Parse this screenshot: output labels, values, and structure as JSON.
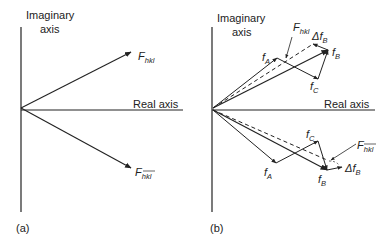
{
  "panels": [
    {
      "id": "a",
      "caption": "(a)",
      "axis_labels": {
        "imaginary_line1": "Imaginary",
        "imaginary_line2": "axis",
        "real": "Real axis"
      },
      "vectors": [
        {
          "name": "F_hkl",
          "symbol": "F",
          "subscript": "hkl",
          "overbar": false
        },
        {
          "name": "F_-h-k-l",
          "symbol": "F",
          "subscript": "hkl",
          "overbar": true
        }
      ]
    },
    {
      "id": "b",
      "caption": "(b)",
      "axis_labels": {
        "imaginary_line1": "Imaginary",
        "imaginary_line2": "axis",
        "real": "Real axis"
      },
      "upper_labels": {
        "fA": {
          "symbol": "f",
          "subscript": "A"
        },
        "fB": {
          "symbol": "f",
          "subscript": "B"
        },
        "fC": {
          "symbol": "f",
          "subscript": "C"
        },
        "dfB": {
          "symbol": "Δf",
          "subscript": "B"
        },
        "F": {
          "symbol": "F",
          "subscript": "hkl",
          "overbar": false
        }
      },
      "lower_labels": {
        "fA": {
          "symbol": "f",
          "subscript": "A"
        },
        "fB": {
          "symbol": "f",
          "subscript": "B"
        },
        "fC": {
          "symbol": "f",
          "subscript": "C"
        },
        "dfB": {
          "symbol": "Δf",
          "subscript": "B"
        },
        "F": {
          "symbol": "F",
          "subscript": "hkl",
          "overbar": true
        }
      }
    }
  ],
  "colors": {
    "ink": "#222222",
    "background": "#ffffff"
  }
}
